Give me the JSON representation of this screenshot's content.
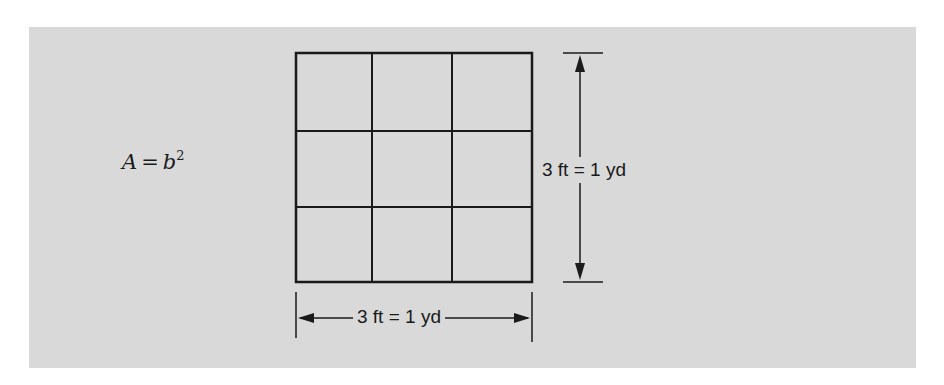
{
  "figure": {
    "formula": {
      "lhs": "A",
      "equals": "=",
      "base": "b",
      "exponent": "2"
    },
    "grid": {
      "rows": 3,
      "cols": 3
    },
    "dimension_right": {
      "label": "3 ft = 1 yd"
    },
    "dimension_bottom": {
      "label": "3 ft = 1 yd"
    },
    "colors": {
      "background": "#d9d9d9",
      "line": "#1a1a1a"
    }
  }
}
